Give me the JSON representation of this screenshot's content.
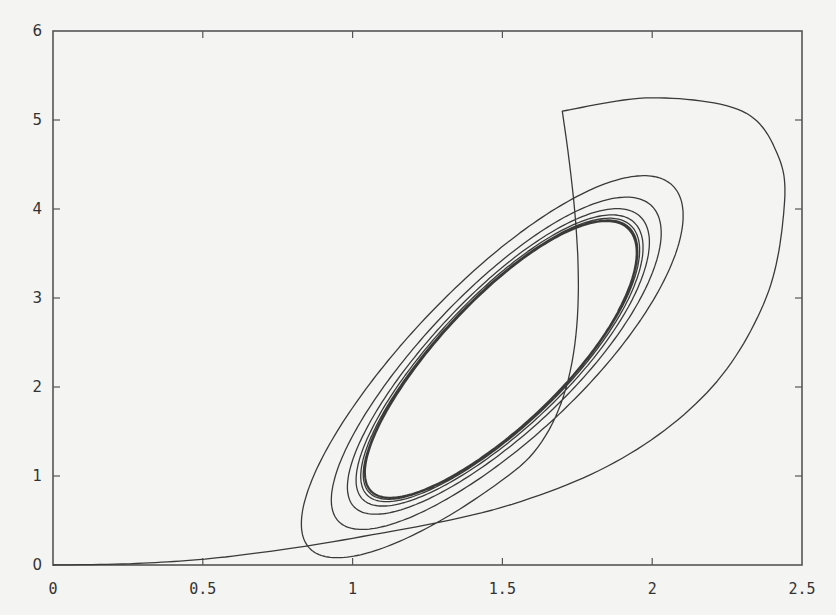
{
  "chart_data": {
    "type": "line",
    "title": "",
    "xlabel": "",
    "ylabel": "",
    "xlim": [
      0,
      2.5
    ],
    "ylim": [
      0,
      6
    ],
    "x_ticks": [
      0,
      0.5,
      1,
      1.5,
      2,
      2.5
    ],
    "x_tick_labels": [
      "0",
      "0.5",
      "1",
      "1.5",
      "2",
      "2.5"
    ],
    "y_ticks": [
      0,
      1,
      2,
      3,
      4,
      5,
      6
    ],
    "y_tick_labels": [
      "0",
      "1",
      "2",
      "3",
      "4",
      "5",
      "6"
    ],
    "grid": false,
    "legend": "none",
    "series": [
      {
        "name": "trajectory",
        "start": [
          0,
          0
        ],
        "initial_transient": [
          [
            0,
            0
          ],
          [
            0.3,
            0.02
          ],
          [
            0.6,
            0.1
          ],
          [
            1.0,
            0.3
          ],
          [
            1.5,
            0.65
          ],
          [
            1.9,
            1.2
          ],
          [
            2.2,
            2.0
          ],
          [
            2.38,
            3.0
          ],
          [
            2.44,
            4.0
          ],
          [
            2.42,
            4.6
          ],
          [
            2.3,
            5.1
          ],
          [
            2.0,
            5.25
          ],
          [
            1.7,
            5.1
          ]
        ],
        "first_loop_extremes": {
          "x_max": 2.45,
          "y_max": 5.25,
          "x_min": 0.6,
          "y_min": 0.45
        },
        "second_loop_extremes": {
          "x_max": 2.19,
          "y_max": 4.28,
          "x_min": 0.78,
          "y_min": 0.63
        },
        "limit_cycle_extremes": {
          "x_min": 0.92,
          "x_max": 2.03,
          "y_min": 0.73,
          "y_max": 3.85
        },
        "spiral_direction": "clockwise",
        "loops_shown": 8
      }
    ]
  }
}
